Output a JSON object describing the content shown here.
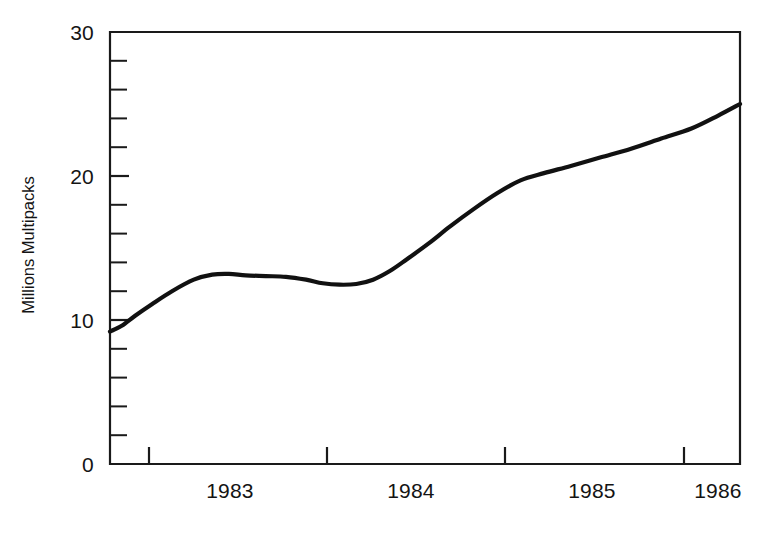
{
  "chart_data": {
    "type": "line",
    "title": "",
    "subtitle": "",
    "xlabel": "",
    "ylabel": "Millions Multipacks",
    "xlim": [
      1982.55,
      1986.31
    ],
    "ylim": [
      0,
      30
    ],
    "grid": false,
    "legend": null,
    "y_ticks_major": [
      0,
      10,
      20,
      30
    ],
    "y_tick_labels": [
      "0",
      "10",
      "20",
      "30"
    ],
    "y_minor_interval": 2,
    "x_ticks": [
      1983,
      1984,
      1985,
      1986
    ],
    "x_tick_labels": [
      "1983",
      "1984",
      "1985",
      "1986"
    ],
    "series": [
      {
        "name": "Millions Multipacks",
        "color": "#111111",
        "x": [
          1982.55,
          1982.62,
          1982.7,
          1982.8,
          1982.92,
          1983.05,
          1983.16,
          1983.26,
          1983.36,
          1983.48,
          1983.6,
          1983.72,
          1983.82,
          1983.92,
          1984.02,
          1984.12,
          1984.22,
          1984.32,
          1984.45,
          1984.58,
          1984.72,
          1984.86,
          1985.0,
          1985.14,
          1985.3,
          1985.48,
          1985.66,
          1985.84,
          1986.02,
          1986.18,
          1986.31
        ],
        "values": [
          9.2,
          9.6,
          10.3,
          11.1,
          12.0,
          12.8,
          13.15,
          13.2,
          13.1,
          13.05,
          13.0,
          12.8,
          12.55,
          12.45,
          12.5,
          12.8,
          13.4,
          14.2,
          15.3,
          16.5,
          17.7,
          18.8,
          19.7,
          20.2,
          20.7,
          21.3,
          21.9,
          22.6,
          23.3,
          24.2,
          25.0
        ]
      }
    ]
  },
  "axes": {
    "y_axis_title": "Millions Multipacks",
    "y_labels": [
      "30",
      "20",
      "10",
      "0"
    ],
    "x_labels": [
      "1983",
      "1984",
      "1985",
      "1986"
    ]
  }
}
